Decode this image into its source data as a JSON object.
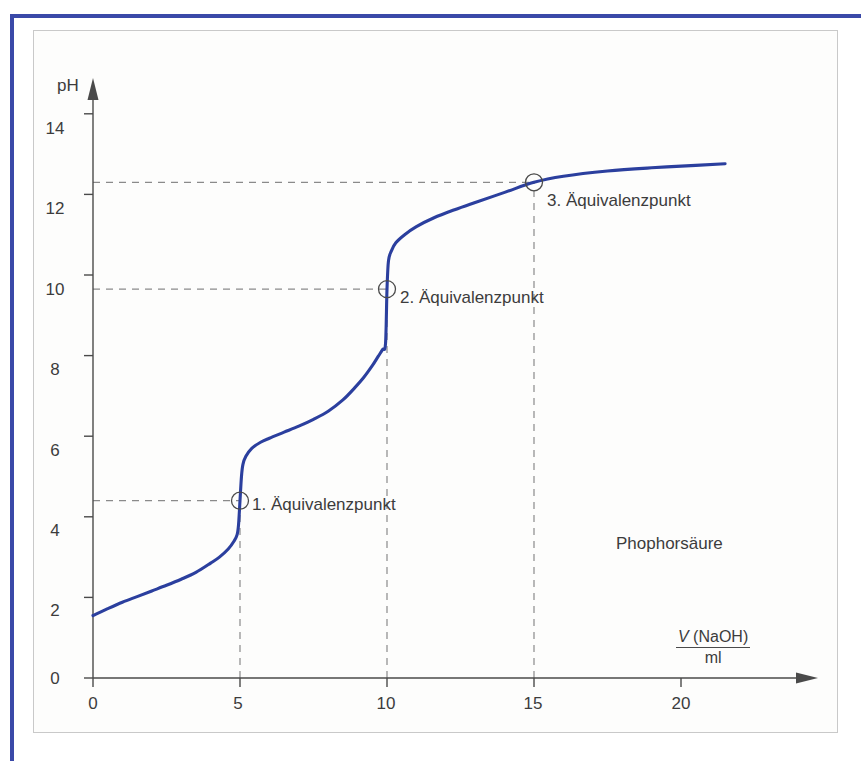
{
  "figure": {
    "substance_label": "Phophorsäure",
    "y_axis_title": "pH",
    "x_axis_numerator_var": "V",
    "x_axis_numerator_rest": " (NaOH)",
    "x_axis_denominator": "ml",
    "curve_color": "#2b3f9e",
    "frame_color": "#3a49a8",
    "panel_border_color": "#c9c9c9",
    "text_color": "#3c3c3c",
    "dash_color": "#8a8a8a"
  },
  "equivalence_points": [
    {
      "label": "1. Äquivalenzpunkt",
      "volume": 5,
      "ph": 4.4,
      "name": "eq-point-1"
    },
    {
      "label": "2. Äquivalenzpunkt",
      "volume": 10,
      "ph": 9.65,
      "name": "eq-point-2"
    },
    {
      "label": "3. Äquivalenzpunkt",
      "volume": 15,
      "ph": 12.3,
      "name": "eq-point-3"
    }
  ],
  "y_ticks": [
    "0",
    "2",
    "4",
    "6",
    "8",
    "10",
    "12",
    "14"
  ],
  "x_ticks": [
    "0",
    "5",
    "10",
    "15",
    "20"
  ],
  "chart_data": {
    "type": "line",
    "title": "",
    "subtitle": "",
    "xlabel": "V (NaOH) / ml",
    "ylabel": "pH",
    "xlim": [
      0,
      23
    ],
    "ylim": [
      0,
      15
    ],
    "xticks": [
      0,
      5,
      10,
      15,
      20
    ],
    "yticks": [
      0,
      2,
      4,
      6,
      8,
      10,
      12,
      14
    ],
    "grid": false,
    "legend": null,
    "series": [
      {
        "name": "Phophorsäure Titrationskurve",
        "color": "#2b3f9e",
        "x": [
          0.0,
          0.5,
          1.0,
          1.5,
          2.0,
          2.5,
          3.0,
          3.5,
          4.0,
          4.3,
          4.6,
          4.8,
          4.9,
          4.95,
          5.0,
          5.05,
          5.1,
          5.2,
          5.4,
          5.7,
          6.0,
          6.5,
          7.0,
          7.5,
          8.0,
          8.5,
          8.9,
          9.2,
          9.5,
          9.7,
          9.85,
          9.95,
          10.0,
          10.05,
          10.15,
          10.3,
          10.6,
          11.0,
          11.6,
          12.3,
          13.0,
          14.0,
          15.0,
          16.0,
          17.5,
          19.0,
          20.5,
          21.5
        ],
        "y": [
          1.55,
          1.72,
          1.88,
          2.02,
          2.16,
          2.3,
          2.45,
          2.62,
          2.85,
          3.0,
          3.2,
          3.4,
          3.55,
          3.8,
          4.4,
          5.0,
          5.3,
          5.5,
          5.7,
          5.85,
          5.95,
          6.1,
          6.25,
          6.42,
          6.62,
          6.9,
          7.2,
          7.45,
          7.75,
          7.98,
          8.15,
          8.3,
          9.65,
          10.35,
          10.6,
          10.8,
          11.0,
          11.2,
          11.42,
          11.62,
          11.8,
          12.05,
          12.3,
          12.45,
          12.58,
          12.66,
          12.72,
          12.76
        ]
      }
    ],
    "annotations": [
      {
        "text": "1. Äquivalenzpunkt",
        "x": 5,
        "y": 4.4
      },
      {
        "text": "2. Äquivalenzpunkt",
        "x": 10,
        "y": 9.65
      },
      {
        "text": "3. Äquivalenzpunkt",
        "x": 15,
        "y": 12.3
      },
      {
        "text": "Phophorsäure",
        "x": 19,
        "y": 3.3
      }
    ],
    "guide_lines": [
      {
        "type": "horizontal",
        "value": 4.4,
        "from_x": 0,
        "to_x": 5,
        "style": "dashed"
      },
      {
        "type": "horizontal",
        "value": 9.65,
        "from_x": 0,
        "to_x": 10,
        "style": "dashed"
      },
      {
        "type": "horizontal",
        "value": 12.3,
        "from_x": 0,
        "to_x": 15,
        "style": "dashed"
      },
      {
        "type": "vertical",
        "value": 5,
        "from_y": 0,
        "to_y": 4.4,
        "style": "dashed"
      },
      {
        "type": "vertical",
        "value": 10,
        "from_y": 0,
        "to_y": 9.65,
        "style": "dashed"
      },
      {
        "type": "vertical",
        "value": 15,
        "from_y": 0,
        "to_y": 12.3,
        "style": "dashed"
      }
    ]
  }
}
